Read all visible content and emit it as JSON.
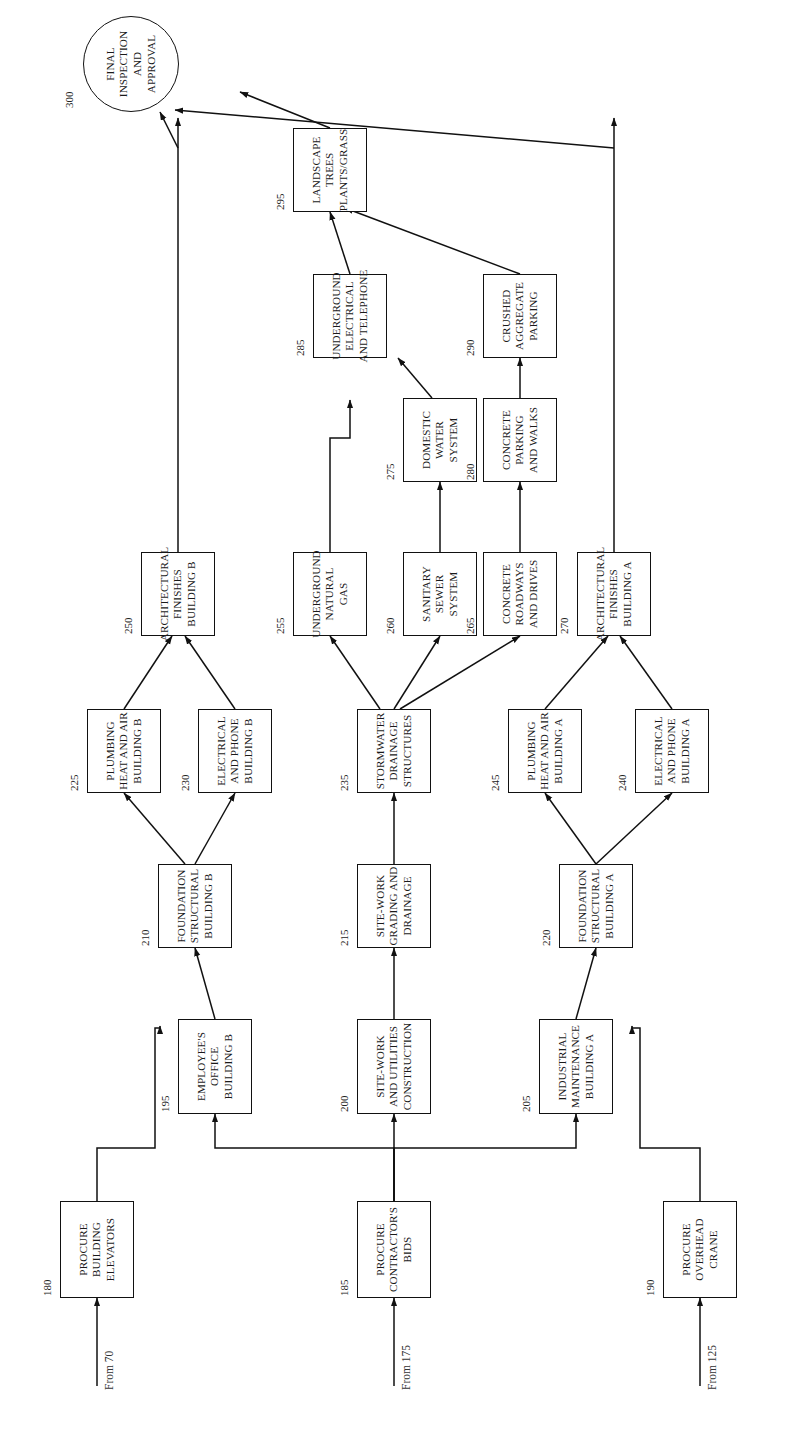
{
  "diagram": {
    "orientation": "rotated-90-ccw",
    "entry_labels": [
      {
        "id": "from-70",
        "text": "From 70"
      },
      {
        "id": "from-175",
        "text": "From 175"
      },
      {
        "id": "from-125",
        "text": "From 125"
      }
    ],
    "nodes": [
      {
        "num": "180",
        "lines": [
          "PROCURE",
          "BUILDING",
          "ELEVATORS"
        ],
        "shape": "box"
      },
      {
        "num": "185",
        "lines": [
          "PROCURE",
          "CONTRACTOR'S",
          "BIDS"
        ],
        "shape": "box"
      },
      {
        "num": "190",
        "lines": [
          "PROCURE",
          "OVERHEAD",
          "CRANE"
        ],
        "shape": "box"
      },
      {
        "num": "195",
        "lines": [
          "EMPLOYEE'S",
          "OFFICE",
          "BUILDING B"
        ],
        "shape": "box"
      },
      {
        "num": "200",
        "lines": [
          "SITE-WORK",
          "AND UTILITIES",
          "CONSTRUCTION"
        ],
        "shape": "box"
      },
      {
        "num": "205",
        "lines": [
          "INDUSTRIAL",
          "MAINTENANCE",
          "BUILDING A"
        ],
        "shape": "box"
      },
      {
        "num": "210",
        "lines": [
          "FOUNDATION",
          "STRUCTURAL",
          "BUILDING B"
        ],
        "shape": "box"
      },
      {
        "num": "215",
        "lines": [
          "SITE-WORK",
          "GRADING AND",
          "DRAINAGE"
        ],
        "shape": "box"
      },
      {
        "num": "220",
        "lines": [
          "FOUNDATION",
          "STRUCTURAL",
          "BUILDING A"
        ],
        "shape": "box"
      },
      {
        "num": "225",
        "lines": [
          "PLUMBING",
          "HEAT AND AIR",
          "BUILDING B"
        ],
        "shape": "box"
      },
      {
        "num": "230",
        "lines": [
          "ELECTRICAL",
          "AND PHONE",
          "BUILDING B"
        ],
        "shape": "box"
      },
      {
        "num": "235",
        "lines": [
          "STORMWATER",
          "DRAINAGE",
          "STRUCTURES"
        ],
        "shape": "box"
      },
      {
        "num": "240",
        "lines": [
          "ELECTRICAL",
          "AND PHONE",
          "BUILDING A"
        ],
        "shape": "box"
      },
      {
        "num": "245",
        "lines": [
          "PLUMBING",
          "HEAT AND AIR",
          "BUILDING A"
        ],
        "shape": "box"
      },
      {
        "num": "250",
        "lines": [
          "ARCHITECTURAL",
          "FINISHES",
          "BUILDING B"
        ],
        "shape": "box"
      },
      {
        "num": "255",
        "lines": [
          "UNDERGROUND",
          "NATURAL",
          "GAS"
        ],
        "shape": "box"
      },
      {
        "num": "260",
        "lines": [
          "SANITARY",
          "SEWER",
          "SYSTEM"
        ],
        "shape": "box"
      },
      {
        "num": "265",
        "lines": [
          "CONCRETE",
          "ROADWAYS",
          "AND DRIVES"
        ],
        "shape": "box"
      },
      {
        "num": "270",
        "lines": [
          "ARCHITECTURAL",
          "FINISHES",
          "BUILDING A"
        ],
        "shape": "box"
      },
      {
        "num": "275",
        "lines": [
          "DOMESTIC",
          "WATER",
          "SYSTEM"
        ],
        "shape": "box"
      },
      {
        "num": "280",
        "lines": [
          "CONCRETE",
          "PARKING",
          "AND WALKS"
        ],
        "shape": "box"
      },
      {
        "num": "285",
        "lines": [
          "UNDERGROUND",
          "ELECTRICAL",
          "AND TELEPHONE"
        ],
        "shape": "box"
      },
      {
        "num": "290",
        "lines": [
          "CRUSHED",
          "AGGREGATE",
          "PARKING"
        ],
        "shape": "box"
      },
      {
        "num": "295",
        "lines": [
          "LANDSCAPE",
          "TREES",
          "PLANTS/GRASS"
        ],
        "shape": "box"
      },
      {
        "num": "300",
        "lines": [
          "FINAL",
          "INSPECTION",
          "AND",
          "APPROVAL"
        ],
        "shape": "circle"
      }
    ],
    "caption": ""
  }
}
